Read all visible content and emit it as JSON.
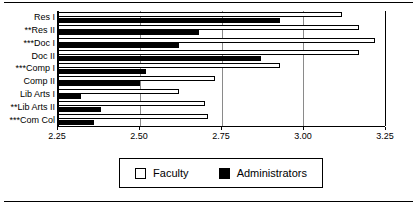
{
  "chart_data": {
    "type": "bar",
    "orientation": "horizontal",
    "title": "",
    "subtitle": "",
    "xlabel": "",
    "ylabel": "",
    "xlim": [
      2.25,
      3.25
    ],
    "xticks": [
      "2.25",
      "2.50",
      "2.75",
      "3.00",
      "3.25"
    ],
    "xtick_values": [
      2.25,
      2.5,
      2.75,
      3.0,
      3.25
    ],
    "grid": true,
    "grid_axis": "x",
    "legend_position": "bottom-center",
    "categories": [
      "Res I",
      "**Res II",
      "***Doc I",
      "Doc II",
      "***Comp I",
      "Comp II",
      "Lib Arts I",
      "**Lib Arts II",
      "***Com Col"
    ],
    "series": [
      {
        "name": "Faculty",
        "color": "#ffffff",
        "edge_color": "#000000",
        "values": [
          3.12,
          3.17,
          3.22,
          3.17,
          2.93,
          2.73,
          2.62,
          2.7,
          2.71
        ]
      },
      {
        "name": "Administrators",
        "color": "#000000",
        "edge_color": "#000000",
        "values": [
          2.93,
          2.68,
          2.62,
          2.87,
          2.52,
          2.5,
          2.32,
          2.38,
          2.36
        ]
      }
    ]
  },
  "legend": {
    "entries": [
      {
        "label": "Faculty",
        "swatch": "hollow-square-swatch"
      },
      {
        "label": "Administrators",
        "swatch": "filled-square-swatch"
      }
    ]
  },
  "colors": {
    "background": "#ffffff",
    "axis": "#000000",
    "gridline": "#8a8a8a",
    "faculty": "#ffffff",
    "administrators": "#000000"
  }
}
